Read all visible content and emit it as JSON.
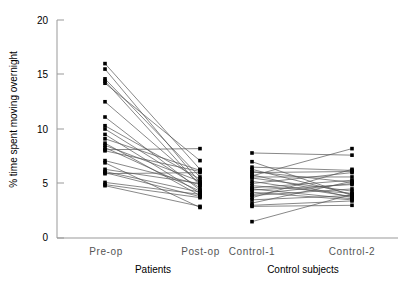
{
  "chart_data": {
    "type": "line",
    "title": "",
    "subtitle": "",
    "xlabel": "",
    "ylabel": "% time spent moving overnight",
    "ylim": [
      0,
      20
    ],
    "yticks": [
      0,
      5,
      10,
      15,
      20
    ],
    "ytick_labels": [
      "0",
      "5",
      "10",
      "15",
      "20"
    ],
    "grid": false,
    "legend": null,
    "categories": [
      "Pre-op",
      "Post-op",
      "Control-1",
      "Control-2"
    ],
    "group_labels": [
      "Patients",
      "Control subjects"
    ],
    "groups": [
      {
        "name": "Patients",
        "categories": [
          "Pre-op",
          "Post-op"
        ],
        "pairs": [
          [
            16.0,
            6.3
          ],
          [
            15.5,
            5.1
          ],
          [
            14.6,
            5.6
          ],
          [
            14.4,
            4.8
          ],
          [
            14.2,
            7.1
          ],
          [
            12.5,
            5.0
          ],
          [
            11.1,
            4.4
          ],
          [
            10.3,
            5.4
          ],
          [
            10.0,
            4.6
          ],
          [
            9.5,
            4.1
          ],
          [
            9.1,
            6.2
          ],
          [
            8.7,
            3.9
          ],
          [
            8.5,
            5.2
          ],
          [
            8.3,
            4.3
          ],
          [
            8.1,
            8.2
          ],
          [
            8.0,
            6.1
          ],
          [
            7.1,
            4.9
          ],
          [
            6.9,
            2.8
          ],
          [
            6.3,
            5.0
          ],
          [
            6.1,
            4.2
          ],
          [
            6.0,
            3.8
          ],
          [
            5.9,
            6.0
          ],
          [
            5.1,
            4.0
          ],
          [
            4.9,
            3.7
          ],
          [
            4.8,
            2.9
          ]
        ]
      },
      {
        "name": "Control subjects",
        "categories": [
          "Control-1",
          "Control-2"
        ],
        "pairs": [
          [
            7.8,
            7.6
          ],
          [
            7.0,
            3.9
          ],
          [
            6.5,
            6.2
          ],
          [
            6.3,
            4.0
          ],
          [
            6.1,
            5.1
          ],
          [
            6.0,
            6.1
          ],
          [
            5.8,
            3.7
          ],
          [
            5.7,
            8.2
          ],
          [
            5.6,
            5.6
          ],
          [
            5.5,
            4.3
          ],
          [
            5.2,
            3.8
          ],
          [
            5.0,
            6.0
          ],
          [
            4.8,
            4.1
          ],
          [
            4.6,
            5.3
          ],
          [
            4.5,
            3.6
          ],
          [
            4.4,
            4.9
          ],
          [
            4.2,
            3.5
          ],
          [
            4.0,
            5.0
          ],
          [
            3.9,
            4.5
          ],
          [
            3.7,
            6.3
          ],
          [
            3.5,
            3.9
          ],
          [
            3.2,
            5.2
          ],
          [
            3.0,
            3.4
          ],
          [
            2.9,
            3.0
          ],
          [
            1.5,
            4.0
          ]
        ]
      }
    ],
    "marker": "square",
    "marker_color": "#000000",
    "line_color": "#555555"
  },
  "axes": {
    "y_axis_label": "% time spent moving overnight",
    "y_tick_0": "0",
    "y_tick_5": "5",
    "y_tick_10": "10",
    "y_tick_15": "15",
    "y_tick_20": "20",
    "x_tick_1": "Pre-op",
    "x_tick_2": "Post-op",
    "x_tick_3": "Control-1",
    "x_tick_4": "Control-2",
    "group_1": "Patients",
    "group_2": "Control subjects"
  }
}
